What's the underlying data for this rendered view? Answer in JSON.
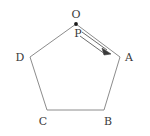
{
  "figure": {
    "type": "geometry-diagram",
    "shape": "regular-pentagon",
    "background_color": "#ffffff",
    "edge_color": "#8c8c8c",
    "label_color": "#3a3a3a",
    "vector_color": "#5a5a5a",
    "marker_color": "#1a1a1a",
    "width": 150,
    "height": 136,
    "polygon_path": "M 76,24 L 120,57 L 104,110 L 47,110 L 30,57 Z",
    "vertices": [
      {
        "id": "O",
        "label": "O",
        "x": 76,
        "y": 24,
        "label_x": 76,
        "label_y": 15,
        "has_marker": true
      },
      {
        "id": "A",
        "label": "A",
        "x": 120,
        "y": 57,
        "label_x": 129,
        "label_y": 58,
        "has_marker": false
      },
      {
        "id": "B",
        "label": "B",
        "x": 104,
        "y": 110,
        "label_x": 108,
        "label_y": 122,
        "has_marker": false
      },
      {
        "id": "C",
        "label": "C",
        "x": 47,
        "y": 110,
        "label_x": 43,
        "label_y": 122,
        "has_marker": false
      },
      {
        "id": "D",
        "label": "D",
        "x": 30,
        "y": 57,
        "label_x": 20,
        "label_y": 58,
        "has_marker": false
      }
    ],
    "point_labels": [
      {
        "id": "P",
        "label": "P",
        "x": 78,
        "y": 34
      }
    ],
    "vector": {
      "id": "P-to-A",
      "from_label": "P",
      "to_label": "A",
      "start_x": 82,
      "start_y": 33,
      "end_x": 111,
      "end_y": 54,
      "style": "double-line-arrow",
      "head_path": "M 111,54 L 102,48 L 104,55 Z",
      "line_a": "M 82,32 L 107,50",
      "line_b": "M 80,36 L 105,54"
    }
  }
}
